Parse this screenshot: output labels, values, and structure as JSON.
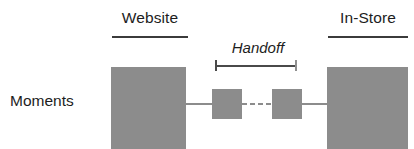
{
  "diagram": {
    "title_row_label": "Moments",
    "columns": [
      {
        "id": "website",
        "label": "Website"
      },
      {
        "id": "in-store",
        "label": "In-Store"
      }
    ],
    "annotation": {
      "label": "Handoff",
      "style": "italic",
      "bracket": "span-bracket"
    },
    "nodes": [
      {
        "id": "website-large",
        "kind": "large-square",
        "column": "website"
      },
      {
        "id": "handoff-left",
        "kind": "small-square",
        "column": "handoff"
      },
      {
        "id": "handoff-right",
        "kind": "small-square",
        "column": "handoff"
      },
      {
        "id": "instore-large",
        "kind": "large-square",
        "column": "in-store"
      }
    ],
    "connectors": [
      {
        "id": "website-to-handoff",
        "style": "solid"
      },
      {
        "id": "handoff-gap",
        "style": "dashed",
        "dash_count": 4
      },
      {
        "id": "handoff-to-instore",
        "style": "solid"
      }
    ],
    "colors": {
      "node_fill": "#8c8c8c",
      "connector": "#8c8c8c",
      "rule": "#3b3b3b",
      "bracket": "#4a4a4a",
      "text": "#1d1d1d",
      "background": "#ffffff"
    }
  }
}
